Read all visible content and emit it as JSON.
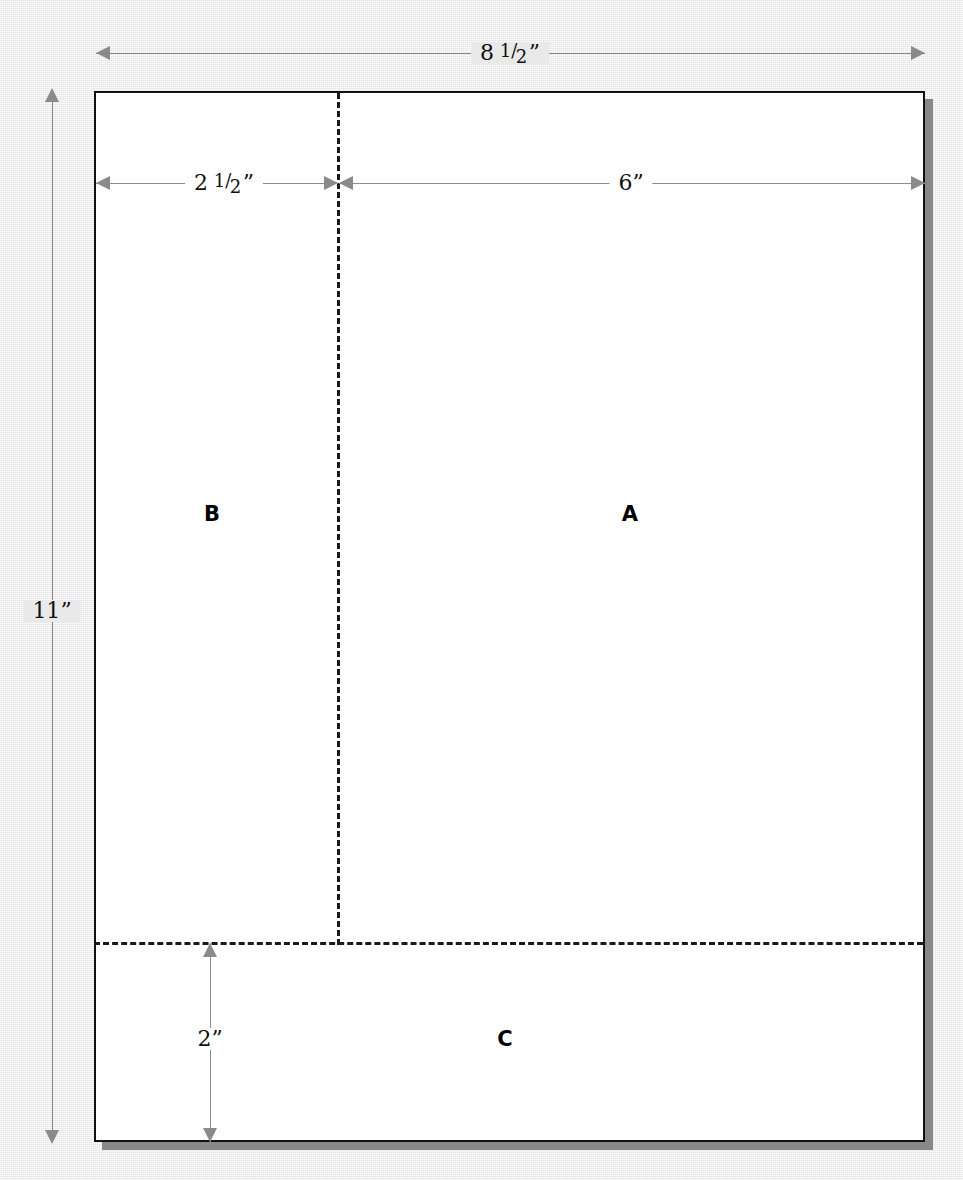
{
  "diagram": {
    "paper": {
      "width_label": "8 1/2\"",
      "height_label": "11\""
    },
    "colors": {
      "background": "#e9e9e9",
      "paper": "#ffffff",
      "paper_border": "#111111",
      "paper_shadow": "#888888",
      "dimension_line": "#8a8a8a",
      "fold_line": "#1a1a1a",
      "text": "#111111"
    },
    "dimensions": [
      {
        "name": "overall-width",
        "whole": "8",
        "numerator": "1",
        "denominator": "2",
        "unit": "”",
        "text": "8 1/2”",
        "orientation": "horizontal"
      },
      {
        "name": "overall-height",
        "whole": "11",
        "numerator": "",
        "denominator": "",
        "unit": "”",
        "text": "11”",
        "orientation": "vertical"
      },
      {
        "name": "left-panel-width",
        "whole": "2",
        "numerator": "1",
        "denominator": "2",
        "unit": "”",
        "text": "2 1/2”",
        "orientation": "horizontal"
      },
      {
        "name": "right-panel-width",
        "whole": "6",
        "numerator": "",
        "denominator": "",
        "unit": "”",
        "text": "6”",
        "orientation": "horizontal"
      },
      {
        "name": "bottom-panel-height",
        "whole": "2",
        "numerator": "",
        "denominator": "",
        "unit": "”",
        "text": "2”",
        "orientation": "vertical"
      }
    ],
    "zones": [
      {
        "name": "zone-a",
        "label": "A"
      },
      {
        "name": "zone-b",
        "label": "B"
      },
      {
        "name": "zone-c",
        "label": "C"
      }
    ]
  }
}
